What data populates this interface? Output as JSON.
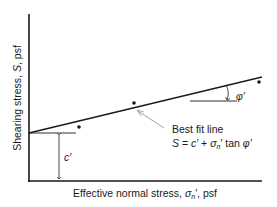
{
  "diagram": {
    "type": "Mohr-Coulomb failure envelope",
    "y_axis_label": {
      "prefix": "Shearing stress, ",
      "symbol": "S",
      "suffix": ", psf"
    },
    "x_axis_label": {
      "prefix": "Effective normal stress, ",
      "symbol": "σ",
      "sub": "n",
      "prime": "′",
      "suffix": ", psf"
    },
    "cohesion_label": "c′",
    "angle_label": "φ′",
    "annotation": {
      "line1": "Best fit line",
      "eq_S": "S",
      "eq_eq": " = ",
      "eq_c": "c′",
      "eq_plus": " + ",
      "eq_sigma": "σ",
      "eq_sub": "n",
      "eq_prime": "′",
      "eq_tan": " tan ",
      "eq_phi": "φ′"
    },
    "data_points": [
      {
        "x": 79,
        "y": 127
      },
      {
        "x": 134,
        "y": 103
      },
      {
        "x": 259,
        "y": 82
      }
    ],
    "colors": {
      "ink": "#1a1a1a",
      "leader": "#888888",
      "background": "#ffffff"
    }
  }
}
